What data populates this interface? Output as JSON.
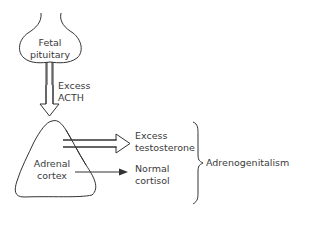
{
  "diagram": {
    "nodes": {
      "pituitary": {
        "line1": "Fetal",
        "line2": "pituitary"
      },
      "acth": {
        "line1": "Excess",
        "line2": "ACTH"
      },
      "adrenal": {
        "line1": "Adrenal",
        "line2": "cortex"
      },
      "testosterone": {
        "line1": "Excess",
        "line2": "testosterone"
      },
      "cortisol": {
        "line1": "Normal",
        "line2": "cortisol"
      },
      "outcome": {
        "label": "Adrenogenitalism"
      }
    },
    "edges": [
      {
        "from": "pituitary",
        "to": "adrenal",
        "label": "Excess ACTH",
        "style": "double-outline-arrow"
      },
      {
        "from": "adrenal",
        "to": "testosterone",
        "style": "double-outline-arrow"
      },
      {
        "from": "adrenal",
        "to": "cortisol",
        "style": "solid-arrow"
      },
      {
        "from": [
          "testosterone",
          "cortisol"
        ],
        "to": "outcome",
        "style": "brace"
      }
    ],
    "colors": {
      "stroke": "#333333",
      "text": "#3a3a3a",
      "background": "#ffffff"
    }
  }
}
